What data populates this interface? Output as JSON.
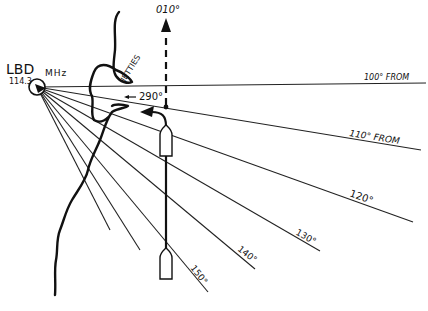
{
  "station": {
    "id": "LBD",
    "frequency": "114.3",
    "unit": "MHz"
  },
  "labels": {
    "jetties": "JETTIES",
    "turn_heading": "290°",
    "north_heading": "010°"
  },
  "radials": [
    {
      "label": "100° FROM",
      "bearing": 100
    },
    {
      "label": "110° FROM",
      "bearing": 110
    },
    {
      "label": "120°",
      "bearing": 120
    },
    {
      "label": "130°",
      "bearing": 130
    },
    {
      "label": "140°",
      "bearing": 140
    },
    {
      "label": "150°",
      "bearing": 150
    }
  ],
  "colors": {
    "ink": "#111111",
    "background": "#ffffff"
  }
}
